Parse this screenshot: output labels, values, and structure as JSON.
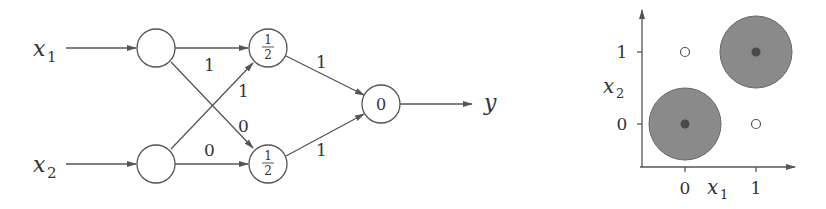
{
  "network": {
    "inputs": [
      {
        "label": "x",
        "sub": "1"
      },
      {
        "label": "x",
        "sub": "2"
      }
    ],
    "hidden": [
      {
        "threshold_num": "1",
        "threshold_den": "2"
      },
      {
        "threshold_num": "1",
        "threshold_den": "2"
      }
    ],
    "output": {
      "threshold": "0",
      "label": "y"
    },
    "weights": {
      "x1_h1": "1",
      "x2_h1": "1",
      "x1_h2": "0",
      "x2_h2": "0",
      "h1_out": "1",
      "h2_out": "1"
    }
  },
  "plot": {
    "xlabel": "x",
    "xlabel_sub": "1",
    "ylabel": "x",
    "ylabel_sub": "2",
    "xticks": [
      "0",
      "1"
    ],
    "yticks": [
      "0",
      "1"
    ],
    "points": [
      {
        "x": 0,
        "y": 0,
        "class": "filled"
      },
      {
        "x": 1,
        "y": 1,
        "class": "filled"
      },
      {
        "x": 0,
        "y": 1,
        "class": "open"
      },
      {
        "x": 1,
        "y": 0,
        "class": "open"
      }
    ],
    "colors": {
      "region": "#8a8a8a",
      "dot": "#4a4a4a"
    }
  }
}
